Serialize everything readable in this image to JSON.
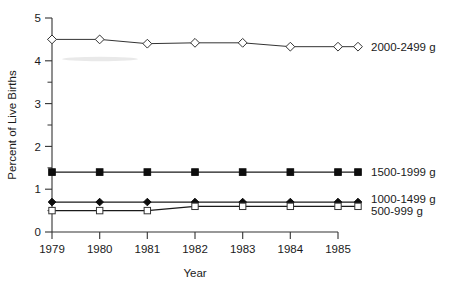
{
  "chart_data": {
    "type": "line",
    "title": "",
    "subtitle": "",
    "xlabel": "Year",
    "ylabel": "Percent of Live Births",
    "x": [
      1979,
      1980,
      1981,
      1982,
      1983,
      1984,
      1985
    ],
    "categories": [
      "1979",
      "1980",
      "1981",
      "1982",
      "1983",
      "1984",
      "1985"
    ],
    "xlim": [
      1979,
      1985
    ],
    "ylim": [
      0,
      5
    ],
    "yticks": [
      0,
      1,
      2,
      3,
      4,
      5
    ],
    "yticklabels": [
      "0",
      "1",
      "2",
      "3",
      "4",
      "5"
    ],
    "yminorticks": [
      0.5,
      1.5,
      2.5,
      3.5,
      4.5
    ],
    "grid": false,
    "legend_position": "right-inline",
    "series": [
      {
        "name": "2000-2499 g",
        "marker": "open-diamond",
        "values": [
          4.5,
          4.5,
          4.4,
          4.42,
          4.42,
          4.33,
          4.33
        ]
      },
      {
        "name": "1500-1999 g",
        "marker": "filled-square",
        "values": [
          1.4,
          1.4,
          1.4,
          1.4,
          1.4,
          1.4,
          1.4
        ]
      },
      {
        "name": "1000-1499 g",
        "marker": "filled-diamond",
        "values": [
          0.7,
          0.7,
          0.7,
          0.7,
          0.7,
          0.7,
          0.7
        ]
      },
      {
        "name": "500-999 g",
        "marker": "open-square",
        "values": [
          0.5,
          0.5,
          0.5,
          0.6,
          0.6,
          0.6,
          0.6
        ]
      }
    ]
  },
  "labels": {
    "y_axis_title": "Percent of Live Births",
    "x_axis_title": "Year",
    "y_0": "0",
    "y_1": "1",
    "y_2": "2",
    "y_3": "3",
    "y_4": "4",
    "y_5": "5",
    "x_1979": "1979",
    "x_1980": "1980",
    "x_1981": "1981",
    "x_1982": "1982",
    "x_1983": "1983",
    "x_1984": "1984",
    "x_1985": "1985",
    "legend_2000_2499": "2000-2499 g",
    "legend_1500_1999": "1500-1999 g",
    "legend_1000_1499": "1000-1499 g",
    "legend_500_999": "500-999 g"
  },
  "colors": {
    "background": "#ffffff",
    "axis": "#333333",
    "line": "#333333",
    "marker_fill": "#0d0d0d",
    "marker_open": "#ffffff",
    "text": "#1a1a1a"
  }
}
